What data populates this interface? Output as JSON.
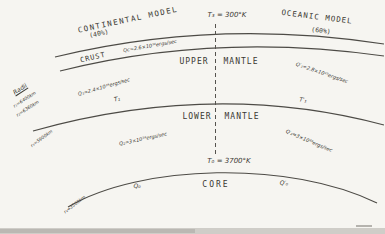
{
  "figure": {
    "continental": {
      "title": "CONTINENTAL MODEL",
      "fraction": "(40%)"
    },
    "oceanic": {
      "title": "OCEANIC MODEL",
      "fraction": "(60%)"
    },
    "surface_temperature": "T₃ = 300°K",
    "crust": {
      "label": "CRUST",
      "heat_flow": "Qc=2.6×10¹⁸ergs/sec"
    },
    "upper_mantle": {
      "word1": "UPPER",
      "word2": "MANTLE",
      "q_continental": "Q₁=2.4×10¹⁹ergs/sec",
      "t_continental": "T₁",
      "q_oceanic": "Q′₁=2.8×10¹⁹ergs/sec",
      "t_oceanic": "T′₁"
    },
    "lower_mantle": {
      "word1": "LOWER",
      "word2": "MANTLE",
      "q_continental": "Q₂=3×10¹⁹ergs/sec",
      "q_oceanic": "Q′₂=3×10¹⁹ergs/sec"
    },
    "core": {
      "label": "CORE",
      "boundary_temperature": "T₀ = 3700°K",
      "q_continental": "Q₀",
      "q_oceanic": "Q′₀"
    },
    "radii": {
      "heading": "Radii",
      "r1": "r₁=6400km",
      "r2": "r₂=6360km",
      "r3": "r₃=5900km",
      "r4": "r₄=3500km"
    },
    "colors": {
      "ink": "#3a3832",
      "line": "#4d4b46",
      "paper": "#f6f5f1"
    }
  }
}
